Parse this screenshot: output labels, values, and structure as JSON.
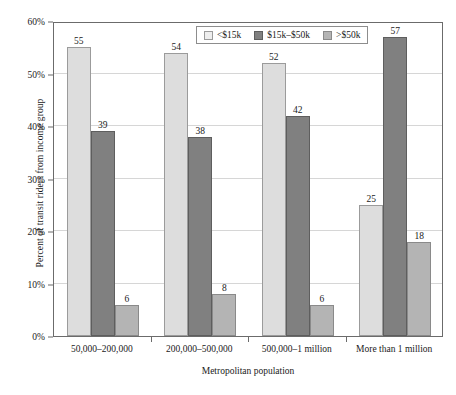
{
  "chart_data": {
    "type": "bar",
    "title": "",
    "xlabel": "Metropolitan population",
    "ylabel": "Percent of transit riders from income group",
    "categories": [
      "50,000–200,000",
      "200,000–500,000",
      "500,000–1 million",
      "More than 1 million"
    ],
    "series": [
      {
        "name": "<$15k",
        "values": [
          55,
          54,
          52,
          25
        ],
        "color": "#dddddd"
      },
      {
        "name": "$15k–$50k",
        "values": [
          39,
          38,
          42,
          57
        ],
        "color": "#808080"
      },
      {
        "name": ">$50k",
        "values": [
          6,
          8,
          6,
          18
        ],
        "color": "#b4b4b4"
      }
    ],
    "ylim": [
      0,
      60
    ],
    "yticks": [
      0,
      10,
      20,
      30,
      40,
      50,
      60
    ],
    "ytick_labels": [
      "0%",
      "10%",
      "20%",
      "30%",
      "40%",
      "50%",
      "60%"
    ],
    "grid": true,
    "legend_position": "top-center",
    "value_labels": true
  },
  "axis": {
    "y_title": "Percent of transit riders from income group",
    "x_title": "Metropolitan population"
  }
}
